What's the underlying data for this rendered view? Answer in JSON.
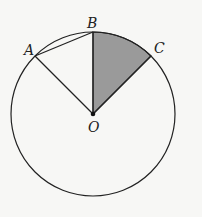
{
  "diagram": {
    "type": "circle-sector",
    "center": {
      "label": "O",
      "x": 93,
      "y": 114
    },
    "radius": 82,
    "points": [
      {
        "label": "A",
        "x": 35,
        "y": 57
      },
      {
        "label": "B",
        "x": 93,
        "y": 32
      },
      {
        "label": "C",
        "x": 151,
        "y": 57
      }
    ],
    "segments": [
      "OA",
      "OB",
      "OC",
      "AB"
    ],
    "shaded_sector": {
      "from": "B",
      "to": "C",
      "color": "#9a9a9a"
    },
    "colors": {
      "stroke": "#222222",
      "fill": "#9a9a9a",
      "background": "#f7f7f5"
    }
  },
  "labels": {
    "A": "A",
    "B": "B",
    "C": "C",
    "O": "O"
  }
}
